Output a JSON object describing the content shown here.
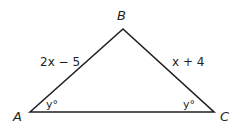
{
  "diagram": {
    "type": "triangle",
    "vertices": {
      "A": {
        "label": "A"
      },
      "B": {
        "label": "B"
      },
      "C": {
        "label": "C"
      }
    },
    "sides": {
      "AB": {
        "label": "2x − 5"
      },
      "BC": {
        "label": "x + 4"
      }
    },
    "angles": {
      "A": {
        "label": "y°"
      },
      "C": {
        "label": "y°"
      }
    },
    "colors": {
      "stroke": "#231f20",
      "background": "#ffffff"
    }
  }
}
